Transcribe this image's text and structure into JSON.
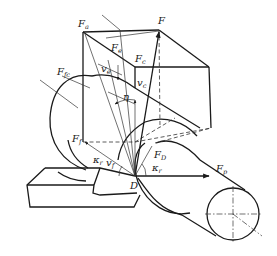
{
  "diagram": {
    "labels": {
      "Fa": {
        "main": "F",
        "sub": "a"
      },
      "F": {
        "main": "F",
        "sub": ""
      },
      "Fe": {
        "main": "F",
        "sub": "e"
      },
      "Fc": {
        "main": "F",
        "sub": "c"
      },
      "Ffc": {
        "main": "F",
        "sub": "fc"
      },
      "ve_left": {
        "main": "v",
        "sub": "e"
      },
      "vc": {
        "main": "v",
        "sub": "c"
      },
      "eta": {
        "main": "η",
        "sub": ""
      },
      "Ff": {
        "main": "F",
        "sub": "f"
      },
      "kappa_r_left": {
        "main": "κ",
        "sub": "r"
      },
      "vf": {
        "main": "v",
        "sub": "f"
      },
      "FD": {
        "main": "F",
        "sub": "D"
      },
      "kappa_r_right": {
        "main": "κ",
        "sub": "r"
      },
      "D": {
        "main": "D",
        "sub": ""
      },
      "Fp": {
        "main": "F",
        "sub": "p"
      }
    },
    "points": {
      "Fa": [
        83,
        32
      ],
      "F": [
        159,
        30
      ],
      "back_right_top": [
        209,
        67
      ],
      "Fc": [
        135,
        67
      ],
      "Fp": [
        211,
        128
      ],
      "Ff": [
        83,
        142
      ],
      "D": [
        135,
        176
      ]
    },
    "colors": {
      "line": "#1a1a1a",
      "background": "#ffffff"
    }
  }
}
